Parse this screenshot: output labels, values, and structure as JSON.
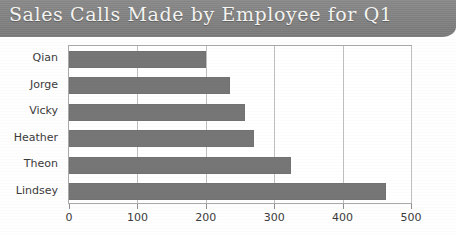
{
  "chart_data": {
    "type": "bar",
    "orientation": "horizontal",
    "title": "Sales Calls Made by Employee for Q1",
    "xlabel": "",
    "ylabel": "",
    "categories": [
      "Qian",
      "Jorge",
      "Vicky",
      "Heather",
      "Theon",
      "Lindsey"
    ],
    "values": [
      200,
      235,
      258,
      270,
      325,
      463
    ],
    "xlim": [
      0,
      500
    ],
    "xticks": [
      0,
      100,
      200,
      300,
      400,
      500
    ],
    "xtick_labels": [
      "0",
      "100",
      "200",
      "300",
      "400",
      "500"
    ],
    "grid": "vertical",
    "legend": "none",
    "series": [
      {
        "name": "Sales Calls",
        "values": [
          200,
          235,
          258,
          270,
          325,
          463
        ]
      }
    ]
  },
  "style": {
    "bar_color": "#767676",
    "banner_color": "#828282",
    "title_color": "#f3f3f0",
    "plot_background": "#ffffff",
    "grid_color": "#bfbfbf",
    "axis_border_color": "#a9a9a9",
    "tick_label_color": "#3b3b3b"
  }
}
